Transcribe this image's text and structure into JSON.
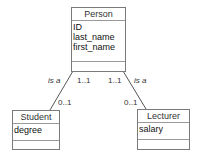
{
  "diagram": {
    "type": "UML class diagram",
    "classes": [
      {
        "name": "Person",
        "attributes": [
          "ID",
          "last_name",
          "first_name"
        ],
        "operations": []
      },
      {
        "name": "Student",
        "attributes": [
          "degree"
        ],
        "operations": []
      },
      {
        "name": "Lecturer",
        "attributes": [
          "salary"
        ],
        "operations": []
      }
    ],
    "associations": [
      {
        "from": "Person",
        "to": "Student",
        "label": "is a",
        "from_multiplicity": "1..1",
        "to_multiplicity": "0..1"
      },
      {
        "from": "Person",
        "to": "Lecturer",
        "label": "is a",
        "from_multiplicity": "1..1",
        "to_multiplicity": "0..1"
      }
    ]
  },
  "colors": {
    "border": "#7a7a7a",
    "line": "#555555",
    "text": "#222222"
  }
}
